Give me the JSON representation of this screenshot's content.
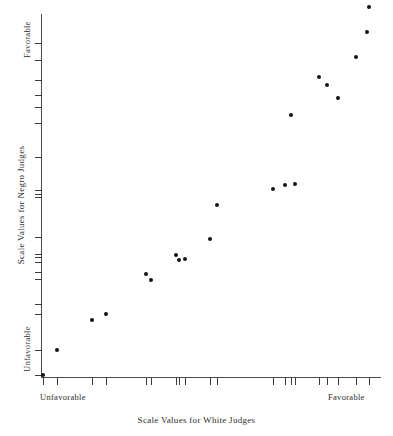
{
  "figure": {
    "background_color": "#ffffff",
    "point_color": "#141414",
    "axis_color": "#4b4b4b"
  },
  "labels": {
    "x_axis_title": "Scale Values for White Judges",
    "y_axis_title": "Scale Values for Negro Judges",
    "x_low": "Unfavorable",
    "x_high": "Favorable",
    "y_low": "Unfavorable",
    "y_high": "Favorable"
  },
  "chart_data": {
    "type": "scatter",
    "title": "",
    "xlabel": "Scale Values for White Judges",
    "ylabel": "Scale Values for Negro Judges",
    "xlim": [
      0,
      11
    ],
    "ylim": [
      0,
      11
    ],
    "grid": false,
    "legend": false,
    "x_tick_labels": [
      "Unfavorable",
      "Favorable"
    ],
    "y_tick_labels": [
      "Unfavorable",
      "Favorable"
    ],
    "x_ticks": [
      0.05,
      0.5,
      1.65,
      2.1,
      3.4,
      3.55,
      4.35,
      4.45,
      4.65,
      5.45,
      5.7,
      7.5,
      7.9,
      8.1,
      8.2,
      9.0,
      9.25,
      9.6,
      10.2,
      10.6
    ],
    "y_ticks": [
      0.05,
      0.8,
      1.9,
      2.2,
      2.95,
      3.15,
      3.45,
      3.6,
      3.7,
      4.2,
      5.4,
      5.5,
      5.6,
      6.6,
      7.6,
      8.1,
      8.45,
      8.9,
      9.5,
      10.0
    ],
    "points": [
      {
        "x": 0.05,
        "y": 0.05
      },
      {
        "x": 0.5,
        "y": 0.8
      },
      {
        "x": 1.65,
        "y": 1.7
      },
      {
        "x": 2.1,
        "y": 1.9
      },
      {
        "x": 3.4,
        "y": 3.1
      },
      {
        "x": 3.55,
        "y": 2.9
      },
      {
        "x": 4.35,
        "y": 3.65
      },
      {
        "x": 4.45,
        "y": 3.5
      },
      {
        "x": 4.65,
        "y": 3.55
      },
      {
        "x": 5.45,
        "y": 4.15
      },
      {
        "x": 5.7,
        "y": 5.15
      },
      {
        "x": 7.5,
        "y": 5.65
      },
      {
        "x": 7.9,
        "y": 5.75
      },
      {
        "x": 8.2,
        "y": 5.8
      },
      {
        "x": 8.1,
        "y": 7.85
      },
      {
        "x": 9.0,
        "y": 9.0
      },
      {
        "x": 9.25,
        "y": 8.75
      },
      {
        "x": 9.6,
        "y": 8.35
      },
      {
        "x": 10.2,
        "y": 9.6
      },
      {
        "x": 10.55,
        "y": 10.35
      },
      {
        "x": 10.6,
        "y": 11.1
      }
    ]
  }
}
